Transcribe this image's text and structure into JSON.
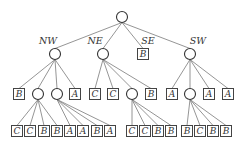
{
  "root": {
    "x": 122,
    "y": 17
  },
  "quadrant_labels": [
    {
      "text": "NW",
      "x": 48,
      "y": 44
    },
    {
      "text": "NE",
      "x": 95,
      "y": 44
    },
    {
      "text": "SE",
      "x": 148,
      "y": 44
    },
    {
      "text": "SW",
      "x": 198,
      "y": 44
    }
  ],
  "level1": [
    {
      "id": "nw",
      "type": "circle",
      "x": 55,
      "y": 54
    },
    {
      "id": "ne",
      "type": "circle",
      "x": 103,
      "y": 54
    },
    {
      "id": "se",
      "type": "leaf",
      "label": "B",
      "x": 143,
      "y": 54
    },
    {
      "id": "sw",
      "type": "circle",
      "x": 190,
      "y": 54
    }
  ],
  "level2": [
    {
      "parent": "nw",
      "type": "leaf",
      "label": "B",
      "x": 19,
      "y": 94
    },
    {
      "parent": "nw",
      "id": "nw2",
      "type": "circle",
      "x": 38,
      "y": 94
    },
    {
      "parent": "nw",
      "id": "nw3",
      "type": "circle",
      "x": 57,
      "y": 94
    },
    {
      "parent": "nw",
      "type": "leaf",
      "label": "A",
      "x": 75,
      "y": 94
    },
    {
      "parent": "ne",
      "type": "leaf",
      "label": "C",
      "x": 95,
      "y": 94
    },
    {
      "parent": "ne",
      "type": "leaf",
      "label": "C",
      "x": 113,
      "y": 94
    },
    {
      "parent": "ne",
      "id": "ne3",
      "type": "circle",
      "x": 132,
      "y": 94
    },
    {
      "parent": "ne",
      "type": "leaf",
      "label": "B",
      "x": 151,
      "y": 94
    },
    {
      "parent": "sw",
      "type": "leaf",
      "label": "A",
      "x": 172,
      "y": 94
    },
    {
      "parent": "sw",
      "id": "sw2",
      "type": "circle",
      "x": 190,
      "y": 94
    },
    {
      "parent": "sw",
      "type": "leaf",
      "label": "A",
      "x": 209,
      "y": 94
    },
    {
      "parent": "sw",
      "type": "leaf",
      "label": "A",
      "x": 228,
      "y": 94
    }
  ],
  "level3": [
    {
      "parent": "nw2",
      "label": "C",
      "x": 17,
      "y": 131
    },
    {
      "parent": "nw2",
      "label": "C",
      "x": 30,
      "y": 131
    },
    {
      "parent": "nw2",
      "label": "B",
      "x": 44,
      "y": 131
    },
    {
      "parent": "nw2",
      "label": "B",
      "x": 57,
      "y": 131
    },
    {
      "parent": "nw3",
      "label": "A",
      "x": 70,
      "y": 131
    },
    {
      "parent": "nw3",
      "label": "A",
      "x": 83,
      "y": 131
    },
    {
      "parent": "nw3",
      "label": "B",
      "x": 97,
      "y": 131
    },
    {
      "parent": "nw3",
      "label": "A",
      "x": 110,
      "y": 131
    },
    {
      "parent": "ne3",
      "label": "C",
      "x": 132,
      "y": 131
    },
    {
      "parent": "ne3",
      "label": "C",
      "x": 145,
      "y": 131
    },
    {
      "parent": "ne3",
      "label": "B",
      "x": 158,
      "y": 131
    },
    {
      "parent": "ne3",
      "label": "B",
      "x": 171,
      "y": 131
    },
    {
      "parent": "sw2",
      "label": "B",
      "x": 187,
      "y": 131
    },
    {
      "parent": "sw2",
      "label": "C",
      "x": 200,
      "y": 131
    },
    {
      "parent": "sw2",
      "label": "B",
      "x": 213,
      "y": 131
    },
    {
      "parent": "sw2",
      "label": "B",
      "x": 226,
      "y": 131
    }
  ]
}
